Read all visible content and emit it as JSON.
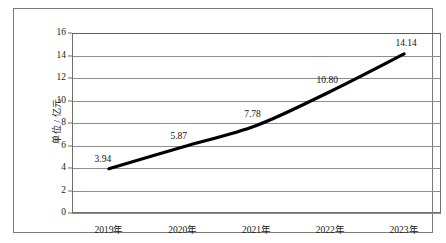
{
  "chart_data": {
    "type": "line",
    "title": "",
    "xlabel": "",
    "ylabel": "单位 / 亿元",
    "categories": [
      "2019年",
      "2020年",
      "2021年",
      "2022年",
      "2023年"
    ],
    "values": [
      3.94,
      5.87,
      7.78,
      10.8,
      14.14
    ],
    "data_labels": [
      "3.94",
      "5.87",
      "7.78",
      "10.80",
      "14.14"
    ],
    "ylim": [
      0,
      16
    ],
    "ytick_step": 2,
    "yticks": [
      "0",
      "2",
      "4",
      "6",
      "8",
      "10",
      "12",
      "14",
      "16"
    ],
    "grid": true,
    "legend": "none",
    "series": [
      {
        "name": "",
        "values": [
          3.94,
          5.87,
          7.78,
          10.8,
          14.14
        ]
      }
    ],
    "colors": {
      "line": "#000000",
      "gridline": "#8d8d8d",
      "axis": "#6f6f6f",
      "frame": "#7a7a7a",
      "text": "#1a1a1a",
      "background": "#ffffff"
    }
  }
}
